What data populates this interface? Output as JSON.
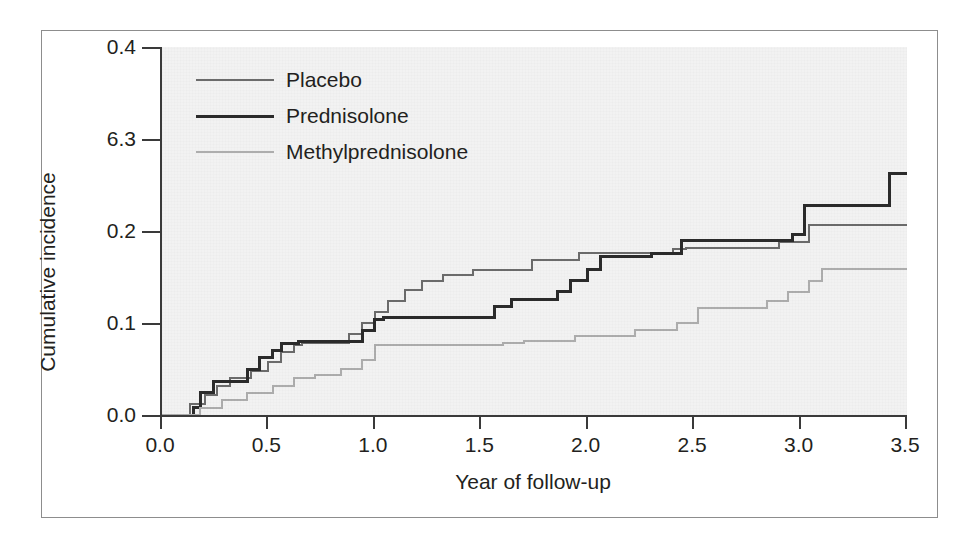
{
  "chart_data": {
    "type": "line",
    "subtype": "step",
    "title": "",
    "xlabel": "Year of follow-up",
    "ylabel": "Cumulative incidence",
    "xlim": [
      0.0,
      3.5
    ],
    "ylim": [
      0.0,
      0.4
    ],
    "xticks": [
      "0.0",
      "0.5",
      "1.0",
      "1.5",
      "2.0",
      "2.5",
      "3.0",
      "3.5"
    ],
    "xtick_values": [
      0.0,
      0.5,
      1.0,
      1.5,
      2.0,
      2.5,
      3.0,
      3.5
    ],
    "yticks": [
      "0.0",
      "0.1",
      "0.2",
      "6.3",
      "0.4"
    ],
    "ytick_values": [
      0.0,
      0.1,
      0.2,
      0.3,
      0.4
    ],
    "grid": false,
    "legend_position": "top-left",
    "plot_background": "#f2f2f2",
    "series": [
      {
        "name": "Placebo",
        "color": "#6b6b6b",
        "width": 2.0,
        "final_value": 0.206,
        "x": [
          0.0,
          0.13,
          0.13,
          0.2,
          0.2,
          0.26,
          0.26,
          0.32,
          0.32,
          0.42,
          0.42,
          0.5,
          0.5,
          0.56,
          0.56,
          0.62,
          0.62,
          0.66,
          0.66,
          0.88,
          0.88,
          0.94,
          0.94,
          1.0,
          1.0,
          1.06,
          1.06,
          1.14,
          1.14,
          1.22,
          1.22,
          1.32,
          1.32,
          1.46,
          1.46,
          1.74,
          1.74,
          1.96,
          1.96,
          2.06,
          2.06,
          2.4,
          2.4,
          2.46,
          2.46,
          2.9,
          2.9,
          3.04,
          3.04,
          3.5
        ],
        "y": [
          0.0,
          0.0,
          0.012,
          0.012,
          0.022,
          0.022,
          0.032,
          0.032,
          0.04,
          0.04,
          0.048,
          0.048,
          0.058,
          0.058,
          0.068,
          0.068,
          0.076,
          0.076,
          0.078,
          0.078,
          0.088,
          0.088,
          0.1,
          0.1,
          0.112,
          0.112,
          0.124,
          0.124,
          0.136,
          0.136,
          0.146,
          0.146,
          0.152,
          0.152,
          0.158,
          0.158,
          0.168,
          0.168,
          0.176,
          0.176,
          0.176,
          0.176,
          0.18,
          0.18,
          0.182,
          0.182,
          0.188,
          0.188,
          0.206,
          0.206
        ]
      },
      {
        "name": "Prednisolone",
        "color": "#2b2b2b",
        "width": 3.0,
        "final_value": 0.263,
        "x": [
          0.0,
          0.15,
          0.15,
          0.18,
          0.18,
          0.24,
          0.24,
          0.4,
          0.4,
          0.46,
          0.46,
          0.52,
          0.52,
          0.56,
          0.56,
          0.64,
          0.64,
          0.94,
          0.94,
          1.0,
          1.0,
          1.04,
          1.04,
          1.56,
          1.56,
          1.64,
          1.64,
          1.86,
          1.86,
          1.92,
          1.92,
          2.0,
          2.0,
          2.06,
          2.06,
          2.3,
          2.3,
          2.44,
          2.44,
          2.96,
          2.96,
          3.02,
          3.02,
          3.42,
          3.42,
          3.5
        ],
        "y": [
          0.0,
          0.0,
          0.008,
          0.008,
          0.024,
          0.024,
          0.036,
          0.036,
          0.05,
          0.05,
          0.062,
          0.062,
          0.07,
          0.07,
          0.078,
          0.078,
          0.08,
          0.08,
          0.092,
          0.092,
          0.104,
          0.104,
          0.106,
          0.106,
          0.118,
          0.118,
          0.126,
          0.126,
          0.134,
          0.134,
          0.146,
          0.146,
          0.158,
          0.158,
          0.172,
          0.172,
          0.176,
          0.176,
          0.19,
          0.19,
          0.196,
          0.196,
          0.228,
          0.228,
          0.263,
          0.263
        ]
      },
      {
        "name": "Methylprednisolone",
        "color": "#adadad",
        "width": 2.0,
        "final_value": 0.159,
        "x": [
          0.0,
          0.18,
          0.18,
          0.28,
          0.28,
          0.4,
          0.4,
          0.52,
          0.52,
          0.62,
          0.62,
          0.72,
          0.72,
          0.84,
          0.84,
          0.94,
          0.94,
          1.0,
          1.0,
          1.6,
          1.6,
          1.7,
          1.7,
          1.94,
          1.94,
          2.22,
          2.22,
          2.42,
          2.42,
          2.52,
          2.52,
          2.84,
          2.84,
          2.94,
          2.94,
          3.04,
          3.04,
          3.1,
          3.1,
          3.5
        ],
        "y": [
          0.0,
          0.0,
          0.008,
          0.008,
          0.016,
          0.016,
          0.024,
          0.024,
          0.032,
          0.032,
          0.04,
          0.04,
          0.044,
          0.044,
          0.05,
          0.05,
          0.06,
          0.06,
          0.076,
          0.076,
          0.078,
          0.078,
          0.08,
          0.08,
          0.086,
          0.086,
          0.092,
          0.092,
          0.1,
          0.1,
          0.116,
          0.116,
          0.124,
          0.124,
          0.134,
          0.134,
          0.146,
          0.146,
          0.159,
          0.159
        ]
      }
    ]
  },
  "legend": {
    "items": [
      {
        "label": "Placebo"
      },
      {
        "label": "Prednisolone"
      },
      {
        "label": "Methylprednisolone"
      }
    ]
  }
}
